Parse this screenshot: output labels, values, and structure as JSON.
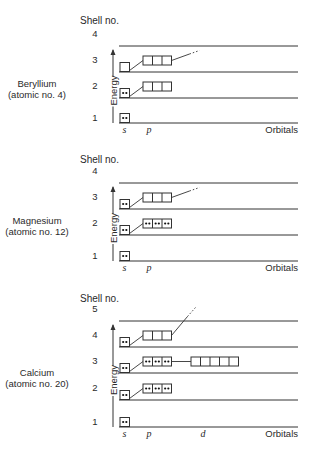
{
  "common": {
    "shell_header": "Shell no.",
    "energy_label": "Energy",
    "orbitals_label": "Orbitals",
    "orbital_letters": {
      "s": "s",
      "p": "p",
      "d": "d"
    }
  },
  "colors": {
    "line": "#333333",
    "text": "#2a2a2a",
    "background": "#ffffff"
  },
  "panels": [
    {
      "element": "Beryllium",
      "atomic_label": "(atomic no. 4)",
      "header_y": 24,
      "shell_lines": [
        {
          "shell": "4",
          "y": 46
        },
        {
          "shell": "3",
          "y": 72
        },
        {
          "shell": "2",
          "y": 98
        },
        {
          "shell": "1",
          "y": 123
        }
      ],
      "orbitals": [
        {
          "type": "s",
          "shell": "1",
          "electrons": [
            2
          ]
        },
        {
          "type": "s",
          "shell": "2",
          "electrons": [
            2
          ]
        },
        {
          "type": "p",
          "shell": "2",
          "electrons": [
            0,
            0,
            0
          ]
        },
        {
          "type": "s",
          "shell": "3",
          "electrons": [
            0
          ]
        },
        {
          "type": "p",
          "shell": "3",
          "electrons": [
            0,
            0,
            0
          ]
        }
      ],
      "orbital_letters_shown": [
        "s",
        "p"
      ]
    },
    {
      "element": "Magnesium",
      "atomic_label": "(atomic no. 12)",
      "header_y": 163,
      "shell_lines": [
        {
          "shell": "4",
          "y": 183
        },
        {
          "shell": "3",
          "y": 209
        },
        {
          "shell": "2",
          "y": 235
        },
        {
          "shell": "1",
          "y": 261
        }
      ],
      "orbitals": [
        {
          "type": "s",
          "shell": "1",
          "electrons": [
            2
          ]
        },
        {
          "type": "s",
          "shell": "2",
          "electrons": [
            2
          ]
        },
        {
          "type": "p",
          "shell": "2",
          "electrons": [
            2,
            2,
            2
          ]
        },
        {
          "type": "s",
          "shell": "3",
          "electrons": [
            2
          ]
        },
        {
          "type": "p",
          "shell": "3",
          "electrons": [
            0,
            0,
            0
          ]
        }
      ],
      "orbital_letters_shown": [
        "s",
        "p"
      ]
    },
    {
      "element": "Calcium",
      "atomic_label": "(atomic no. 20)",
      "header_y": 302,
      "shell_lines": [
        {
          "shell": "5",
          "y": 321
        },
        {
          "shell": "4",
          "y": 347
        },
        {
          "shell": "3",
          "y": 373
        },
        {
          "shell": "2",
          "y": 400
        },
        {
          "shell": "1",
          "y": 427
        }
      ],
      "orbitals": [
        {
          "type": "s",
          "shell": "1",
          "electrons": [
            2
          ]
        },
        {
          "type": "s",
          "shell": "2",
          "electrons": [
            2
          ]
        },
        {
          "type": "p",
          "shell": "2",
          "electrons": [
            2,
            2,
            2
          ]
        },
        {
          "type": "s",
          "shell": "3",
          "electrons": [
            2
          ]
        },
        {
          "type": "p",
          "shell": "3",
          "electrons": [
            2,
            2,
            2
          ]
        },
        {
          "type": "d",
          "shell": "3",
          "electrons": [
            0,
            0,
            0,
            0,
            0
          ]
        },
        {
          "type": "s",
          "shell": "4",
          "electrons": [
            2
          ]
        },
        {
          "type": "p",
          "shell": "4",
          "electrons": [
            0,
            0,
            0
          ]
        }
      ],
      "orbital_letters_shown": [
        "s",
        "p",
        "d"
      ]
    }
  ]
}
